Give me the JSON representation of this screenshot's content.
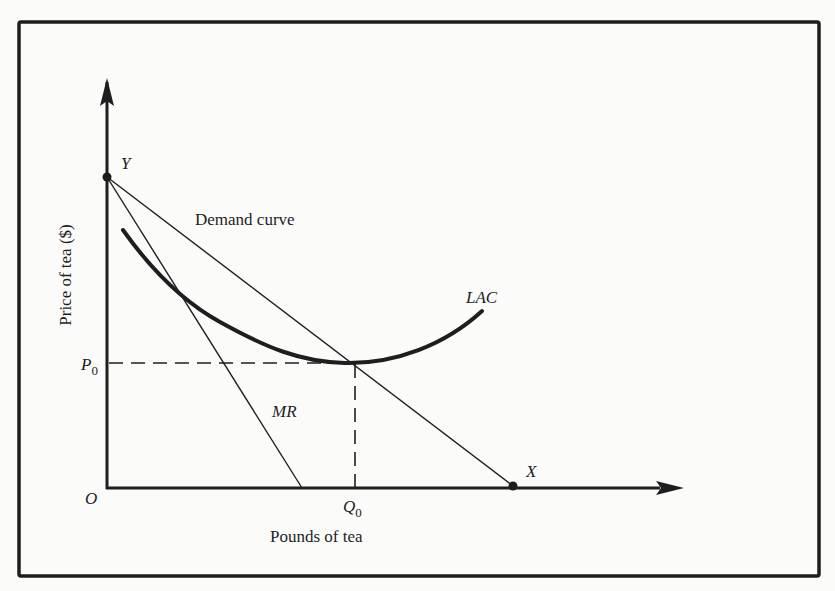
{
  "figure": {
    "type": "economics-diagram",
    "colors": {
      "ink": "#1e1e1e",
      "background": "#fbfbfa"
    }
  },
  "axes": {
    "x_label": "Pounds of tea",
    "y_label": "Price of tea ($)",
    "origin_label": "O"
  },
  "points": {
    "y_intercept_label": "Y",
    "x_intercept_label": "X"
  },
  "curves": {
    "demand_label": "Demand curve",
    "mr_label": "MR",
    "lac_label": "LAC"
  },
  "equilibrium": {
    "price_label": "P",
    "price_subscript": "0",
    "quantity_label": "Q",
    "quantity_subscript": "0"
  }
}
